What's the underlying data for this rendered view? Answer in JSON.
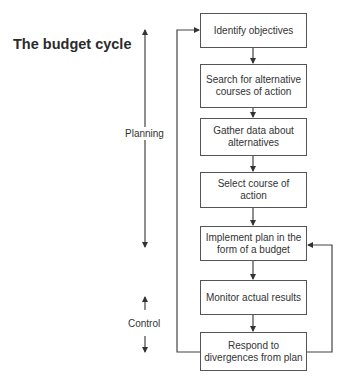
{
  "title": "The budget cycle",
  "phases": {
    "planning": "Planning",
    "control": "Control"
  },
  "steps": [
    {
      "label": "Identify objectives"
    },
    {
      "label": "Search for alternative courses of action"
    },
    {
      "label": "Gather data about alternatives"
    },
    {
      "label": "Select course of action"
    },
    {
      "label": "Implement plan in the form of a budget"
    },
    {
      "label": "Monitor actual results"
    },
    {
      "label": "Respond to divergences from plan"
    }
  ],
  "feedback_loops": [
    {
      "from": "Respond to divergences from plan",
      "to": "Identify objectives",
      "side": "left"
    },
    {
      "from": "Respond to divergences from plan",
      "to": "Implement plan in the form of a budget",
      "side": "right"
    }
  ],
  "colors": {
    "line": "#444444",
    "text": "#2b2b2b",
    "background": "#ffffff"
  }
}
